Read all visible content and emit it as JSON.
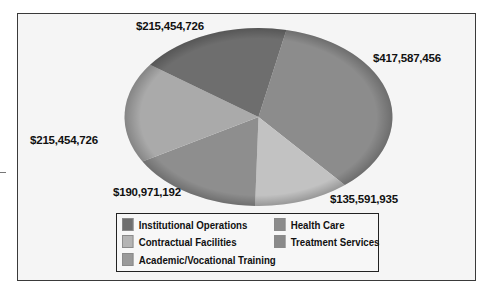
{
  "chart_data": {
    "type": "pie",
    "title": "",
    "slices": [
      {
        "label": "Institutional Operations",
        "value": 215454726,
        "display": "$215,454,726",
        "color": "#6e6e6e"
      },
      {
        "label": "Health Care",
        "value": 417587456,
        "display": "$417,587,456",
        "color": "#8c8c8c"
      },
      {
        "label": "Treatment Services",
        "value": 135591935,
        "display": "$135,591,935",
        "color": "#c2c2c2"
      },
      {
        "label": "Academic/Vocational Training",
        "value": 190971192,
        "display": "$190,971,192",
        "color": "#8e8e8e"
      },
      {
        "label": "Contractual Facilities",
        "value": 215454726,
        "display": "$215,454,726",
        "color": "#aaaaaa"
      }
    ],
    "legend_position": "bottom",
    "legend": [
      "Institutional Operations",
      "Health Care",
      "Contractual Facilities",
      "Treatment Services",
      "Academic/Vocational Training"
    ]
  },
  "labels": {
    "institutional": "$215,454,726",
    "health": "$417,587,456",
    "treatment": "$135,591,935",
    "academic": "$190,971,192",
    "contractual": "$215,454,726"
  },
  "legend": {
    "institutional": "Institutional Operations",
    "health": "Health Care",
    "contractual": "Contractual Facilities",
    "treatment": "Treatment Services",
    "academic": "Academic/Vocational Training"
  }
}
